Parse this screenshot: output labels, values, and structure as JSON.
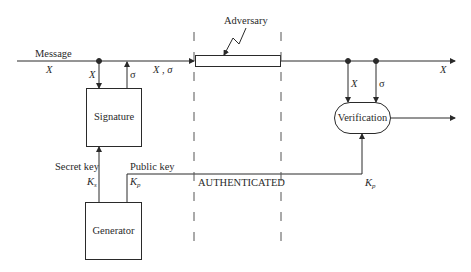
{
  "diagram": {
    "labels": {
      "message": "Message",
      "message_var": "X",
      "x_down_left": "X",
      "sigma_up": "σ",
      "x_sigma": "X , σ",
      "adversary": "Adversary",
      "x_down_right": "X",
      "sigma_down_right": "σ",
      "x_out": "X",
      "secret_key": "Secret key",
      "ks_base": "K",
      "ks_sub": "s",
      "public_key": "Public key",
      "kp_base": "K",
      "kp_sub": "p",
      "authenticated": "AUTHENTICATED",
      "kp_right_base": "K",
      "kp_right_sub": "p"
    },
    "blocks": {
      "signature": "Signature",
      "verification": "Verification",
      "generator": "Generator"
    },
    "colors": {
      "stroke": "#2a2a2a",
      "dashed": "#555555",
      "background": "#ffffff"
    }
  }
}
